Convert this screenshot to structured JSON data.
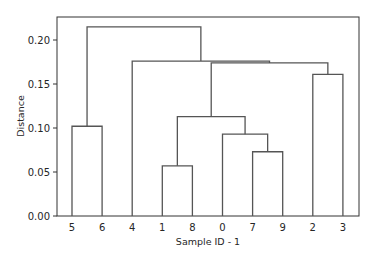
{
  "chart_data": {
    "type": "dendrogram",
    "title": "",
    "xlabel": "Sample ID - 1",
    "ylabel": "Distance",
    "ylim": [
      0,
      0.225
    ],
    "yticks": [
      "0.00",
      "0.05",
      "0.10",
      "0.15",
      "0.20"
    ],
    "leaves": [
      "5",
      "6",
      "4",
      "1",
      "8",
      "0",
      "7",
      "9",
      "2",
      "3"
    ],
    "merges": [
      {
        "left": "1",
        "right": "8",
        "height": 0.057
      },
      {
        "left": "7",
        "right": "9",
        "height": 0.073
      },
      {
        "left": "0",
        "right": "(7,9)",
        "height": 0.093
      },
      {
        "left": "5",
        "right": "6",
        "height": 0.102
      },
      {
        "left": "(1,8)",
        "right": "(0,7,9)",
        "height": 0.113
      },
      {
        "left": "2",
        "right": "3",
        "height": 0.161
      },
      {
        "left": "(1,8,0,7,9)",
        "right": "(2,3)",
        "height": 0.174
      },
      {
        "left": "4",
        "right": "(1,8,0,7,9,2,3)",
        "height": 0.176
      },
      {
        "left": "(5,6)",
        "right": "(4,1,8,0,7,9,2,3)",
        "height": 0.215
      }
    ],
    "line_color": "#555555",
    "grid": false
  }
}
